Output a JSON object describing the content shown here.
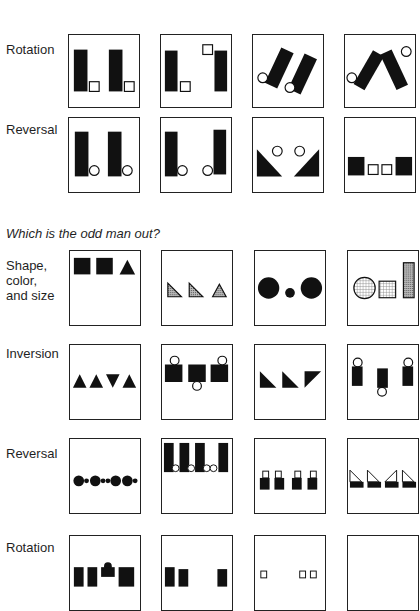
{
  "section1": {
    "rows": [
      {
        "label": "Rotation",
        "panels": [
          "rot-a",
          "rot-b",
          "rot-c",
          "rot-d"
        ]
      },
      {
        "label": "Reversal",
        "panels": [
          "rev-a",
          "rev-b",
          "rev-c",
          "rev-d"
        ]
      }
    ]
  },
  "question": "Which is the odd man out?",
  "section2": {
    "rows": [
      {
        "label": "Shape,\ncolor,\nand size",
        "panels": [
          "scs-a",
          "scs-b",
          "scs-c",
          "scs-d"
        ]
      },
      {
        "label": "Inversion",
        "panels": [
          "inv-a",
          "inv-b",
          "inv-c",
          "inv-d"
        ]
      },
      {
        "label": "Reversal",
        "panels": [
          "rev2-a",
          "rev2-b",
          "rev2-c",
          "rev2-d"
        ]
      },
      {
        "label": "Rotation",
        "panels": [
          "rot2-a",
          "rot2-b",
          "rot2-c",
          "rot2-d"
        ]
      }
    ]
  },
  "colors": {
    "ink": "#111111",
    "border": "#222222",
    "background": "#ffffff",
    "stipple": "#9a9a9a"
  }
}
